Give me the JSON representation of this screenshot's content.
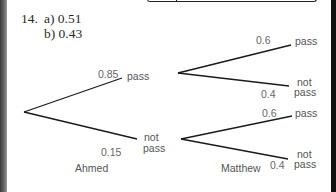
{
  "question": {
    "number": "14.",
    "answers": [
      {
        "part": "a)",
        "value": "0.51",
        "text": "a) 0.51"
      },
      {
        "part": "b)",
        "value": "0.43",
        "text": "b) 0.43"
      }
    ]
  },
  "tree": {
    "first_stage": {
      "name": "Ahmed",
      "branches": [
        {
          "probability": "0.85",
          "outcome": "pass"
        },
        {
          "probability": "0.15",
          "outcome_line1": "not",
          "outcome_line2": "pass"
        }
      ]
    },
    "second_stage": {
      "name": "Matthew",
      "after_pass": [
        {
          "probability": "0.6",
          "outcome": "pass"
        },
        {
          "probability": "0.4",
          "outcome_line1": "not",
          "outcome_line2": "pass"
        }
      ],
      "after_not_pass": [
        {
          "probability": "0.6",
          "outcome": "pass"
        },
        {
          "probability": "0.4",
          "outcome_line1": "not",
          "outcome_line2": "pass"
        }
      ]
    }
  },
  "colors": {
    "line": "#1a1a1a",
    "label": "#555555",
    "answer_text": "#2a2a2a"
  }
}
